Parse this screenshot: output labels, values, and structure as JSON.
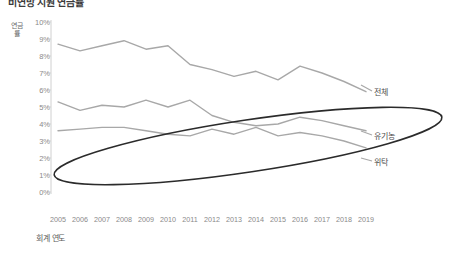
{
  "title": "비연방 지원 연금률",
  "axis": {
    "y_title": "연금률",
    "x_title": "회계 연도",
    "y_ticks": [
      "10%",
      "9%",
      "8%",
      "7%",
      "6%",
      "5%",
      "4%",
      "3%",
      "2%",
      "1%",
      "0%"
    ]
  },
  "series_labels": {
    "total": "전체",
    "organic": "유기농",
    "consignment": "위탁"
  },
  "colors": {
    "line": "#a8a8a8",
    "highlight_ellipse": "#2b2b2b",
    "axis": "#d0d0d0",
    "tick_text": "#8a8a8a"
  },
  "chart_data": {
    "type": "line",
    "title": "비연방 지원 연금률",
    "xlabel": "회계 연도",
    "ylabel": "연금률",
    "ylim": [
      0,
      10
    ],
    "ytick_values": [
      10,
      9,
      8,
      7,
      6,
      5,
      4,
      3,
      2,
      1,
      0
    ],
    "grid": false,
    "legend_position": "right-inline",
    "categories": [
      "2005",
      "2006",
      "2007",
      "2008",
      "2009",
      "2010",
      "2011",
      "2012",
      "2013",
      "2014",
      "2015",
      "2016",
      "2017",
      "2018",
      "2019"
    ],
    "series": [
      {
        "name": "전체",
        "label": "전체",
        "values": [
          8.7,
          8.3,
          8.6,
          8.9,
          8.4,
          8.6,
          7.5,
          7.2,
          6.8,
          7.1,
          6.6,
          7.4,
          7.0,
          6.5,
          5.9
        ]
      },
      {
        "name": "유기농",
        "label": "유기농",
        "values": [
          5.3,
          4.8,
          5.1,
          5.0,
          5.4,
          5.0,
          5.4,
          4.5,
          4.1,
          3.9,
          4.0,
          4.4,
          4.2,
          3.9,
          3.6
        ]
      },
      {
        "name": "위탁",
        "label": "위탁",
        "values": [
          3.6,
          3.7,
          3.8,
          3.8,
          3.6,
          3.4,
          3.3,
          3.7,
          3.4,
          3.8,
          3.3,
          3.5,
          3.3,
          3.0,
          2.6
        ]
      }
    ],
    "annotations": [
      {
        "type": "ellipse",
        "name": "highlight-ellipse",
        "description": "타원 강조 표시"
      }
    ]
  }
}
